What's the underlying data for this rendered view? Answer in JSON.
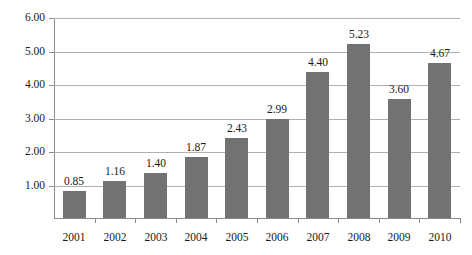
{
  "chart_data": {
    "type": "bar",
    "title": "",
    "subtitle": "",
    "xlabel": "",
    "ylabel": "",
    "categories": [
      "2001",
      "2002",
      "2003",
      "2004",
      "2005",
      "2006",
      "2007",
      "2008",
      "2009",
      "2010"
    ],
    "values": [
      0.85,
      1.16,
      1.4,
      1.87,
      2.43,
      2.99,
      4.4,
      5.23,
      3.6,
      4.67
    ],
    "data_labels": [
      "0.85",
      "1.16",
      "1.40",
      "1.87",
      "2.43",
      "2.99",
      "4.40",
      "5.23",
      "3.60",
      "4.67"
    ],
    "ytick_labels": [
      "6.00",
      "5.00",
      "4.00",
      "3.00",
      "2.00",
      "1.00"
    ],
    "ytick_values": [
      6.0,
      5.0,
      4.0,
      3.0,
      2.0,
      1.0
    ],
    "ylim": [
      0.05,
      6.0
    ],
    "grid": true,
    "legend": "none",
    "series_color": "#727272",
    "gridline_color": "#b0b0b0",
    "axis_color": "#8a8a8a",
    "background_color": "#ffffff"
  }
}
